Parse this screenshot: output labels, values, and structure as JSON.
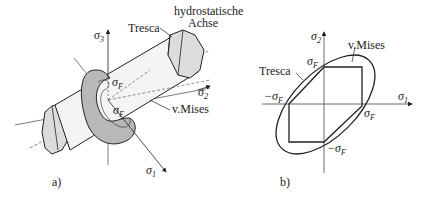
{
  "panel_a": {
    "label": "a)",
    "axes": {
      "sigma1": "σ",
      "sigma1_sub": "1",
      "sigma2": "σ",
      "sigma2_sub": "2",
      "sigma3": "σ",
      "sigma3_sub": "3"
    },
    "labels": {
      "tresca": "Tresca",
      "hydro_line1": "hydrostatische",
      "hydro_line2": "Achse",
      "mises": "v.Mises",
      "sigmaF": "σ",
      "sigmaF_sub": "F"
    }
  },
  "panel_b": {
    "label": "b)",
    "axes": {
      "sigma1": "σ",
      "sigma1_sub": "1",
      "sigma2": "σ",
      "sigma2_sub": "2"
    },
    "labels": {
      "tresca": "Tresca",
      "mises": "v.Mises",
      "sigmaF": "σ",
      "sigmaF_sub": "F",
      "neg_sigmaF": "−σ",
      "neg_sigmaF_sub": "F"
    }
  },
  "colors": {
    "line": "#222222",
    "ring_fill": "#b8b8b8",
    "cylinder_fill": "#f4f4f4",
    "prism_fill": "#dcdcdc"
  }
}
